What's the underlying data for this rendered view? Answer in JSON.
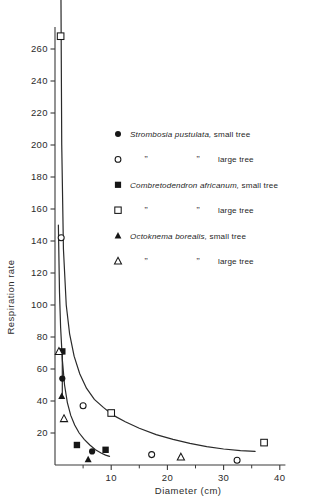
{
  "chart_data": {
    "type": "scatter",
    "title": "",
    "xlabel": "Diameter  (cm)",
    "ylabel": "Respiration rate",
    "xlim": [
      0,
      41
    ],
    "ylim": [
      0,
      275
    ],
    "grid": false,
    "legend_position": "upper-right-inside",
    "xticks": [
      10,
      20,
      30,
      40
    ],
    "xtick_labels": [
      "10",
      "20",
      "30",
      "40"
    ],
    "xminor_ticks": [
      5,
      15,
      25,
      35
    ],
    "yticks": [
      20,
      40,
      60,
      80,
      100,
      120,
      140,
      160,
      180,
      200,
      220,
      240,
      260
    ],
    "ytick_labels": [
      "20",
      "40",
      "60",
      "80",
      "100",
      "120",
      "140",
      "160",
      "180",
      "200",
      "220",
      "240",
      "260"
    ],
    "series": [
      {
        "name": "Strombosia pustulata, small tree",
        "marker": "filled-circle",
        "points": [
          [
            1.3,
            54
          ],
          [
            6.6,
            8.5
          ]
        ]
      },
      {
        "name": "Strombosia pustulata, large tree",
        "marker": "open-circle",
        "points": [
          [
            1.1,
            142
          ],
          [
            5.0,
            37
          ],
          [
            17.2,
            6.5
          ],
          [
            32.4,
            3.0
          ]
        ]
      },
      {
        "name": "Combretodendron africanum, small tree",
        "marker": "filled-square",
        "points": [
          [
            1.3,
            71
          ],
          [
            3.9,
            12.5
          ],
          [
            9.0,
            9.5
          ]
        ]
      },
      {
        "name": "Combretodendron africanum, large tree",
        "marker": "open-square",
        "points": [
          [
            1.0,
            268
          ],
          [
            10.0,
            32.5
          ],
          [
            37.2,
            14.0
          ]
        ]
      },
      {
        "name": "Octoknema borealis, small tree",
        "marker": "filled-triangle",
        "points": [
          [
            1.2,
            43
          ],
          [
            5.9,
            3.5
          ]
        ]
      },
      {
        "name": "Octoknema borealis, large tree",
        "marker": "open-triangle",
        "points": [
          [
            0.7,
            71
          ],
          [
            1.6,
            29
          ],
          [
            22.4,
            5.0
          ]
        ]
      }
    ],
    "curves": [
      {
        "name": "upper-fitted-curve",
        "points": [
          [
            1.05,
            300
          ],
          [
            1.2,
            200
          ],
          [
            1.5,
            135
          ],
          [
            2.0,
            100
          ],
          [
            2.6,
            82
          ],
          [
            3.4,
            68
          ],
          [
            4.4,
            57
          ],
          [
            5.6,
            48
          ],
          [
            7.0,
            41
          ],
          [
            8.6,
            36
          ],
          [
            10.4,
            31
          ],
          [
            12.5,
            27
          ],
          [
            15.0,
            23
          ],
          [
            18.0,
            19
          ],
          [
            21.0,
            16
          ],
          [
            24.0,
            13.5
          ],
          [
            27.0,
            11.5
          ],
          [
            30.0,
            10
          ],
          [
            33.0,
            9
          ],
          [
            35.6,
            8.5
          ]
        ]
      },
      {
        "name": "lower-fitted-curve",
        "points": [
          [
            0.6,
            150
          ],
          [
            0.8,
            108
          ],
          [
            1.0,
            86
          ],
          [
            1.3,
            66
          ],
          [
            1.7,
            50
          ],
          [
            2.2,
            39
          ],
          [
            2.8,
            31
          ],
          [
            3.5,
            25
          ],
          [
            4.3,
            20
          ],
          [
            5.2,
            16
          ],
          [
            6.2,
            12.5
          ],
          [
            7.2,
            9.5
          ],
          [
            8.2,
            7.5
          ],
          [
            9.0,
            6.2
          ],
          [
            9.7,
            5.4
          ]
        ]
      },
      {
        "name": "axis-overlay-vertical-segment",
        "points": [
          [
            1.3,
            71
          ],
          [
            1.3,
            43
          ]
        ]
      }
    ]
  },
  "legend": {
    "entries": [
      {
        "marker": "filled-circle",
        "species": "Strombosia pustulata,",
        "ditto_left": "",
        "ditto_right": "",
        "size": "small tree"
      },
      {
        "marker": "open-circle",
        "species": "",
        "ditto_left": "”",
        "ditto_right": "”",
        "size": "large tree"
      },
      {
        "marker": "filled-square",
        "species": "Combretodendron africanum,",
        "ditto_left": "",
        "ditto_right": "",
        "size": "small tree"
      },
      {
        "marker": "open-square",
        "species": "",
        "ditto_left": "”",
        "ditto_right": "”",
        "size": "large tree"
      },
      {
        "marker": "filled-triangle",
        "species": "Octoknema borealis,",
        "ditto_left": "",
        "ditto_right": "",
        "size": "small tree"
      },
      {
        "marker": "open-triangle",
        "species": "",
        "ditto_left": "”",
        "ditto_right": "”",
        "size": "large tree"
      }
    ]
  },
  "colors": {
    "ink": "#161616",
    "axis": "#3a3a3a",
    "background": "#ffffff"
  }
}
